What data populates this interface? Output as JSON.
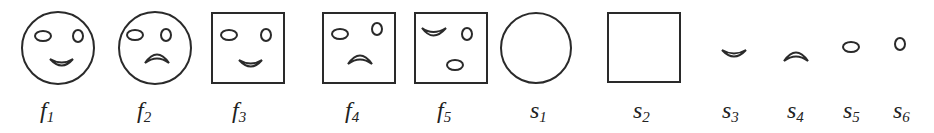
{
  "figure": {
    "stroke_color": "#2a2a2a",
    "items": [
      {
        "id": "f1",
        "base": "f",
        "sub": "1",
        "shape": "circle-face-smile",
        "label_x": 40
      },
      {
        "id": "f2",
        "base": "f",
        "sub": "2",
        "shape": "circle-face-frown",
        "label_x": 137
      },
      {
        "id": "f3",
        "base": "f",
        "sub": "3",
        "shape": "square-face-smile",
        "label_x": 232
      },
      {
        "id": "f4",
        "base": "f",
        "sub": "4",
        "shape": "square-face-frown",
        "label_x": 345
      },
      {
        "id": "f5",
        "base": "f",
        "sub": "5",
        "shape": "square-face-scrambled",
        "label_x": 437
      },
      {
        "id": "s1",
        "base": "s",
        "sub": "1",
        "shape": "circle",
        "label_x": 530
      },
      {
        "id": "s2",
        "base": "s",
        "sub": "2",
        "shape": "square",
        "label_x": 633
      },
      {
        "id": "s3",
        "base": "s",
        "sub": "3",
        "shape": "smile-mouth",
        "label_x": 722
      },
      {
        "id": "s4",
        "base": "s",
        "sub": "4",
        "shape": "frown-mouth",
        "label_x": 787
      },
      {
        "id": "s5",
        "base": "s",
        "sub": "5",
        "shape": "ellipse-eye",
        "label_x": 843
      },
      {
        "id": "s6",
        "base": "s",
        "sub": "6",
        "shape": "small-ellipse-eye",
        "label_x": 893
      }
    ]
  }
}
